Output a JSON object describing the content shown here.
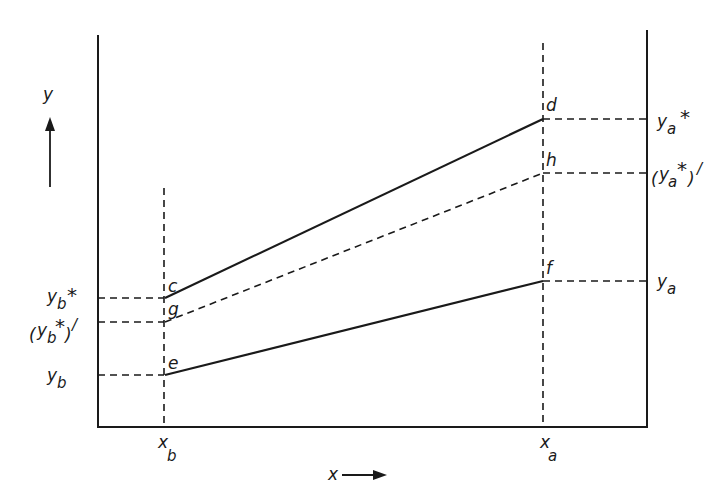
{
  "diagram": {
    "axes": {
      "x_label": "x",
      "y_label": "y"
    },
    "x_ticks": {
      "xb": {
        "base": "x",
        "sub": "b"
      },
      "xa": {
        "base": "x",
        "sub": "a"
      }
    },
    "left_labels": {
      "yb_star": {
        "base": "y",
        "sub": "b",
        "sup": "*",
        "text": "yb*"
      },
      "yb_star_prime": {
        "open": "(",
        "base": "y",
        "sub": "b",
        "sup": "*",
        "close": ")",
        "prime": "/",
        "text": "(yb*)'"
      },
      "yb": {
        "base": "y",
        "sub": "b",
        "text": "yb"
      }
    },
    "right_labels": {
      "ya_star": {
        "base": "y",
        "sub": "a",
        "sup": "*",
        "text": "ya*"
      },
      "ya_star_prime": {
        "open": "(",
        "base": "y",
        "sub": "a",
        "sup": "*",
        "close": ")",
        "prime": "/",
        "text": "(ya*)'"
      },
      "ya": {
        "base": "y",
        "sub": "a",
        "text": "ya"
      }
    },
    "points": {
      "c": "c",
      "d": "d",
      "e": "e",
      "f": "f",
      "g": "g",
      "h": "h"
    },
    "lines": [
      {
        "from": "c",
        "to": "d",
        "style": "solid"
      },
      {
        "from": "g",
        "to": "h",
        "style": "dashed"
      },
      {
        "from": "e",
        "to": "f",
        "style": "solid"
      }
    ]
  }
}
